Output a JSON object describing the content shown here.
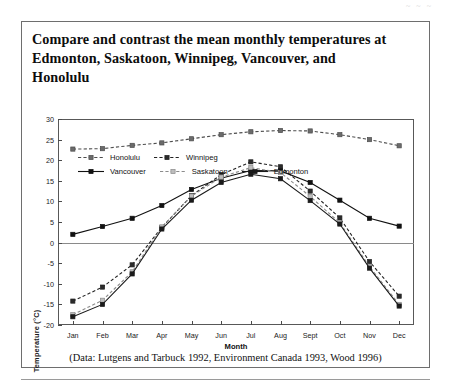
{
  "page": {
    "artifact_text": "~ ~ ~",
    "title": "Compare and contrast the mean monthly temperatures at Edmonton, Saskatoon, Winnipeg, Vancouver, and Honolulu",
    "credit": "(Data: Lutgens and Tarbuck 1992, Environment Canada 1993, Wood 1996)"
  },
  "chart_data": {
    "type": "line",
    "title": "Compare and contrast the mean monthly temperatures at Edmonton, Saskatoon, Winnipeg, Vancouver, and Honolulu",
    "xlabel": "Month",
    "ylabel": "Temperature (°C)",
    "categories": [
      "Jan",
      "Feb",
      "Mar",
      "Apr",
      "May",
      "Jun",
      "Jul",
      "Aug",
      "Sept",
      "Oct",
      "Nov",
      "Dec"
    ],
    "ylim": [
      -20,
      30
    ],
    "yticks": [
      30,
      25,
      20,
      15,
      10,
      5,
      0,
      -5,
      -10,
      -15,
      -20
    ],
    "grid": false,
    "zero_line": true,
    "legend_position": "inside-bottom-left",
    "series": [
      {
        "name": "Honolulu",
        "color": "#4d4d4d",
        "marker": "square",
        "marker_fill": "#6b6b6b",
        "line_style": "dashed",
        "values": [
          22.7,
          22.8,
          23.6,
          24.2,
          25.2,
          26.2,
          26.9,
          27.2,
          27.1,
          26.2,
          25.0,
          23.5
        ]
      },
      {
        "name": "Winnipeg",
        "color": "#222222",
        "marker": "square",
        "marker_fill": "#2b2b2b",
        "line_style": "dashed",
        "values": [
          -14.2,
          -10.8,
          -5.4,
          3.7,
          11.4,
          16.5,
          19.6,
          18.4,
          12.5,
          6.0,
          -4.6,
          -13.0
        ]
      },
      {
        "name": "Vancouver",
        "color": "#111111",
        "marker": "square",
        "marker_fill": "#111111",
        "line_style": "solid",
        "values": [
          2.0,
          3.9,
          5.9,
          9.0,
          12.9,
          15.6,
          17.5,
          17.4,
          14.6,
          10.3,
          5.9,
          4.0
        ]
      },
      {
        "name": "Saskatoon",
        "color": "#8c8c8c",
        "marker": "square",
        "marker_fill": "#bdbdbd",
        "line_style": "dashed",
        "values": [
          -17.5,
          -14.0,
          -7.1,
          3.8,
          11.3,
          15.9,
          18.2,
          17.0,
          11.2,
          4.8,
          -5.8,
          -15.0
        ]
      },
      {
        "name": "Edmonton",
        "color": "#1a1a1a",
        "marker": "square",
        "marker_fill": "#1a1a1a",
        "line_style": "solid",
        "values": [
          -18.0,
          -15.0,
          -7.6,
          3.3,
          10.3,
          14.6,
          16.6,
          15.5,
          10.2,
          4.5,
          -6.2,
          -15.4
        ]
      }
    ],
    "legend_rows": [
      [
        "Honolulu",
        "Winnipeg"
      ],
      [
        "Vancouver",
        "Saskatoon",
        "Edmonton"
      ]
    ]
  }
}
